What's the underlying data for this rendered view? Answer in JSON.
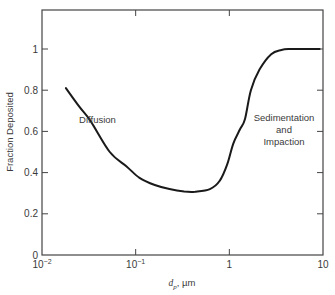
{
  "chart_data": {
    "type": "line",
    "title": "",
    "xlabel": "d_p, µm",
    "xlabel_parts": {
      "symbol": "d",
      "subscript": "p",
      "unit": ", µm"
    },
    "ylabel": "Fraction Deposited",
    "xscale": "log",
    "xlim": [
      0.01,
      10
    ],
    "ylim": [
      0,
      1.15
    ],
    "grid": false,
    "x_ticks": [
      {
        "value": 0.01,
        "base": "10",
        "exp": "−2"
      },
      {
        "value": 0.1,
        "base": "10",
        "exp": "−1"
      },
      {
        "value": 1,
        "base": "1",
        "exp": ""
      },
      {
        "value": 10,
        "base": "10",
        "exp": ""
      }
    ],
    "y_ticks": [
      {
        "value": 0,
        "label": "0"
      },
      {
        "value": 0.2,
        "label": "0.2"
      },
      {
        "value": 0.4,
        "label": "0.4"
      },
      {
        "value": 0.6,
        "label": "0.6"
      },
      {
        "value": 0.8,
        "label": "0.8"
      },
      {
        "value": 1.0,
        "label": "1"
      }
    ],
    "series": [
      {
        "name": "Fraction Deposited",
        "color": "#1a1a1a",
        "x": [
          0.018,
          0.025,
          0.033,
          0.053,
          0.08,
          0.11,
          0.16,
          0.23,
          0.33,
          0.43,
          0.62,
          0.79,
          0.95,
          1.1,
          1.3,
          1.47,
          1.7,
          2.1,
          2.8,
          3.6,
          4.4,
          6.0,
          9.2
        ],
        "y": [
          0.81,
          0.72,
          0.65,
          0.5,
          0.43,
          0.375,
          0.34,
          0.32,
          0.308,
          0.307,
          0.32,
          0.36,
          0.44,
          0.54,
          0.61,
          0.66,
          0.8,
          0.9,
          0.975,
          0.995,
          1.0,
          1.0,
          1.0
        ]
      }
    ],
    "annotations": [
      {
        "text": "Diffusion",
        "x": 0.022,
        "y": 0.63
      },
      {
        "lines": [
          "Sedimentation",
          "and",
          "Impaction"
        ],
        "x": 3.0,
        "y": 0.6
      }
    ]
  }
}
